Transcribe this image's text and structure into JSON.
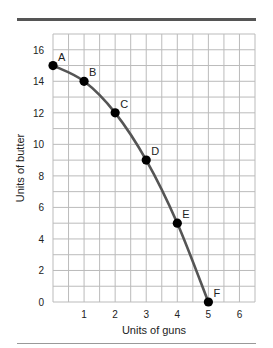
{
  "chart_data": {
    "type": "line",
    "title": "",
    "xlabel": "Units of guns",
    "ylabel": "Units of butter",
    "xlim": [
      0,
      6.5
    ],
    "ylim": [
      0,
      17
    ],
    "x_ticks": [
      1,
      2,
      3,
      4,
      5,
      6
    ],
    "y_ticks": [
      0,
      2,
      4,
      6,
      8,
      10,
      12,
      14,
      16
    ],
    "x_grid_step": 0.5,
    "y_grid_step": 1,
    "grid": true,
    "series": [
      {
        "name": "Production possibilities frontier",
        "color": "#555555",
        "points": [
          {
            "label": "A",
            "x": 0,
            "y": 15
          },
          {
            "label": "B",
            "x": 1,
            "y": 14
          },
          {
            "label": "C",
            "x": 2,
            "y": 12
          },
          {
            "label": "D",
            "x": 3,
            "y": 9
          },
          {
            "label": "E",
            "x": 4,
            "y": 5
          },
          {
            "label": "F",
            "x": 5,
            "y": 0
          }
        ]
      }
    ],
    "marker_color": "#000000",
    "grid_color": "#bbbbbb"
  }
}
